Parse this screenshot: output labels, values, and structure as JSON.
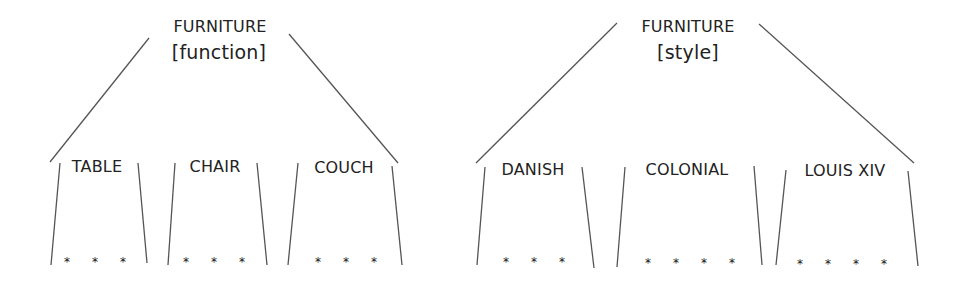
{
  "trees": [
    {
      "id": "function",
      "root": {
        "label": "FURNITURE",
        "qualifier": "[function]"
      },
      "children": [
        {
          "label": "TABLE",
          "members": [
            "*",
            "*",
            "*"
          ]
        },
        {
          "label": "CHAIR",
          "members": [
            "*",
            "*",
            "*"
          ]
        },
        {
          "label": "COUCH",
          "members": [
            "*",
            "*",
            "*"
          ]
        }
      ]
    },
    {
      "id": "style",
      "root": {
        "label": "FURNITURE",
        "qualifier": "[style]"
      },
      "children": [
        {
          "label": "DANISH",
          "members": [
            "*",
            "*",
            "*"
          ]
        },
        {
          "label": "COLONIAL",
          "members": [
            "*",
            "*",
            "*",
            "*"
          ]
        },
        {
          "label": "LOUIS XIV",
          "members": [
            "*",
            "*",
            "*",
            "*"
          ]
        }
      ]
    }
  ],
  "colors": {
    "line": "#555555",
    "text": "#222222",
    "background": "#ffffff"
  }
}
